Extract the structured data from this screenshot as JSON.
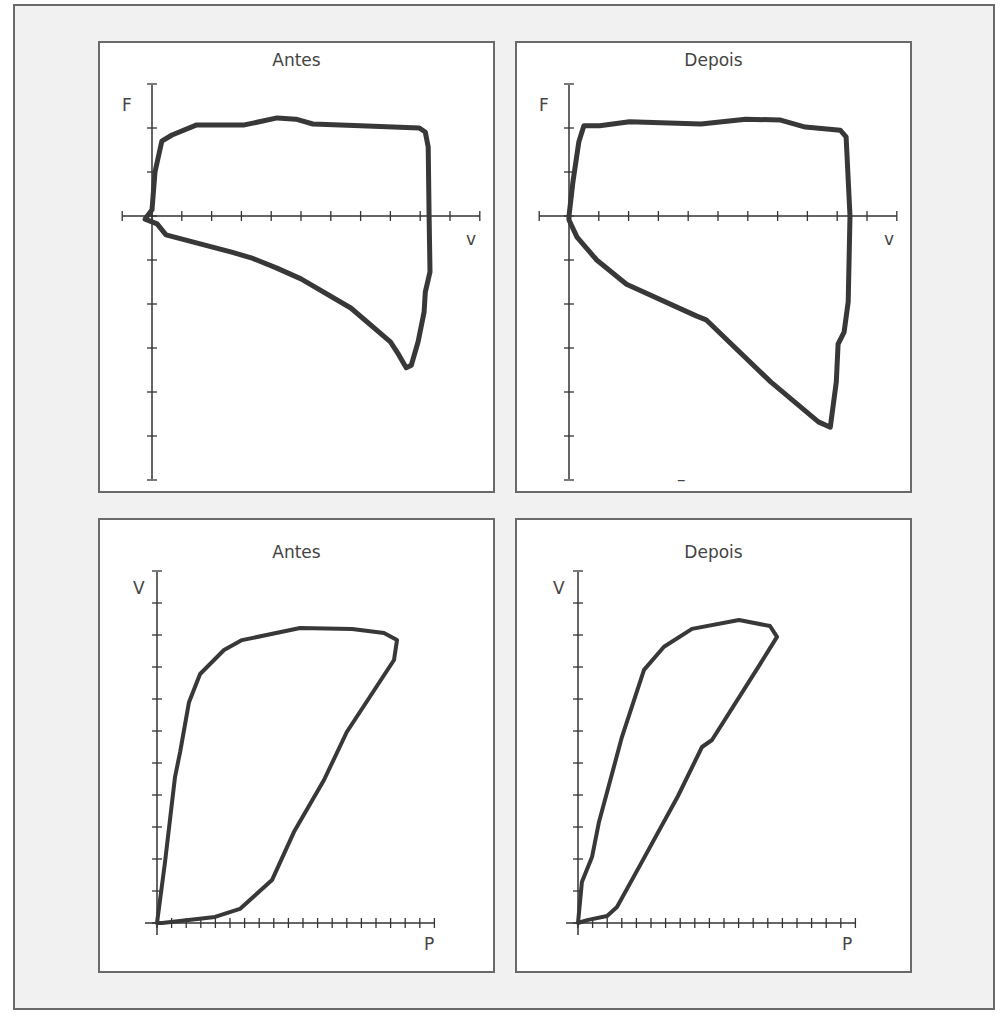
{
  "chart_data": [
    {
      "id": "fv-antes",
      "type": "line",
      "title": "Antes",
      "xlabel": "v",
      "ylabel": "F",
      "xlim": [
        -1,
        11
      ],
      "ylim": [
        -6,
        3
      ],
      "x_ticks": [
        -1,
        0,
        1,
        2,
        3,
        4,
        5,
        6,
        7,
        8,
        9,
        10,
        11
      ],
      "y_ticks": [
        -6,
        -5,
        -4,
        -3,
        -2,
        -1,
        0,
        1,
        2,
        3
      ],
      "grid": false,
      "series": [
        {
          "name": "F-v loop",
          "closed": true,
          "points": [
            [
              0,
              0.14
            ],
            [
              0.1,
              1.0
            ],
            [
              0.33,
              1.7
            ],
            [
              0.67,
              1.84
            ],
            [
              1.5,
              2.07
            ],
            [
              3.1,
              2.07
            ],
            [
              3.6,
              2.14
            ],
            [
              4.2,
              2.23
            ],
            [
              4.83,
              2.2
            ],
            [
              5.4,
              2.09
            ],
            [
              7.0,
              2.05
            ],
            [
              8.97,
              2.0
            ],
            [
              9.17,
              1.91
            ],
            [
              9.27,
              1.57
            ],
            [
              9.3,
              0
            ],
            [
              9.33,
              -1.27
            ],
            [
              9.17,
              -1.73
            ],
            [
              9.13,
              -2.18
            ],
            [
              8.93,
              -2.86
            ],
            [
              8.7,
              -3.39
            ],
            [
              8.53,
              -3.45
            ],
            [
              8.27,
              -3.14
            ],
            [
              8.0,
              -2.86
            ],
            [
              6.67,
              -2.09
            ],
            [
              5.0,
              -1.43
            ],
            [
              4.17,
              -1.18
            ],
            [
              3.33,
              -0.95
            ],
            [
              2.67,
              -0.82
            ],
            [
              2.0,
              -0.7
            ],
            [
              0.47,
              -0.43
            ],
            [
              0.17,
              -0.18
            ],
            [
              -0.23,
              -0.07
            ]
          ]
        }
      ]
    },
    {
      "id": "fv-depois",
      "type": "line",
      "title": "Depois",
      "xlabel": "v",
      "ylabel": "F",
      "xlim": [
        -1,
        11
      ],
      "ylim": [
        -6,
        3
      ],
      "x_ticks": [
        -1,
        0,
        1,
        2,
        3,
        4,
        5,
        6,
        7,
        8,
        9,
        10,
        11
      ],
      "y_ticks": [
        -6,
        -5,
        -4,
        -3,
        -2,
        -1,
        0,
        1,
        2,
        3
      ],
      "grid": false,
      "annotation": "–",
      "series": [
        {
          "name": "F-v loop",
          "closed": true,
          "points": [
            [
              0,
              0
            ],
            [
              0.13,
              0.77
            ],
            [
              0.33,
              1.68
            ],
            [
              0.5,
              2.05
            ],
            [
              1.03,
              2.05
            ],
            [
              2.03,
              2.14
            ],
            [
              4.43,
              2.09
            ],
            [
              5.93,
              2.2
            ],
            [
              7.1,
              2.18
            ],
            [
              7.93,
              2.02
            ],
            [
              9.1,
              1.95
            ],
            [
              9.3,
              1.8
            ],
            [
              9.43,
              0
            ],
            [
              9.37,
              -1.95
            ],
            [
              9.23,
              -2.64
            ],
            [
              9.03,
              -2.91
            ],
            [
              8.97,
              -3.77
            ],
            [
              8.77,
              -4.8
            ],
            [
              8.37,
              -4.68
            ],
            [
              6.77,
              -3.77
            ],
            [
              4.6,
              -2.36
            ],
            [
              4.27,
              -2.27
            ],
            [
              1.93,
              -1.55
            ],
            [
              0.93,
              -1.0
            ],
            [
              0.27,
              -0.48
            ],
            [
              0,
              -0.09
            ]
          ]
        }
      ]
    },
    {
      "id": "vp-antes",
      "type": "line",
      "title": "Antes",
      "xlabel": "P",
      "ylabel": "V",
      "xlim": [
        0,
        19
      ],
      "ylim": [
        0,
        11
      ],
      "x_ticks": [
        0,
        1,
        2,
        3,
        4,
        5,
        6,
        7,
        8,
        9,
        10,
        11,
        12,
        13,
        14,
        15,
        16,
        17,
        18,
        19
      ],
      "y_ticks": [
        0,
        1,
        2,
        3,
        4,
        5,
        6,
        7,
        8,
        9,
        10,
        11
      ],
      "grid": false,
      "series": [
        {
          "name": "P-V loop",
          "closed": true,
          "points": [
            [
              0,
              0
            ],
            [
              0.55,
              1.9
            ],
            [
              1.23,
              4.56
            ],
            [
              1.58,
              5.34
            ],
            [
              2.19,
              6.9
            ],
            [
              2.95,
              7.78
            ],
            [
              4.59,
              8.53
            ],
            [
              5.82,
              8.84
            ],
            [
              9.8,
              9.22
            ],
            [
              13.36,
              9.19
            ],
            [
              15.55,
              9.06
            ],
            [
              16.44,
              8.84
            ],
            [
              16.23,
              8.22
            ],
            [
              13.0,
              5.97
            ],
            [
              11.44,
              4.47
            ],
            [
              9.38,
              2.84
            ],
            [
              7.88,
              1.34
            ],
            [
              5.68,
              0.44
            ],
            [
              3.97,
              0.19
            ],
            [
              0.34,
              0
            ]
          ]
        }
      ]
    },
    {
      "id": "vp-depois",
      "type": "line",
      "title": "Depois",
      "xlabel": "P",
      "ylabel": "V",
      "xlim": [
        0,
        19
      ],
      "ylim": [
        0,
        11
      ],
      "x_ticks": [
        0,
        1,
        2,
        3,
        4,
        5,
        6,
        7,
        8,
        9,
        10,
        11,
        12,
        13,
        14,
        15,
        16,
        17,
        18,
        19
      ],
      "y_ticks": [
        0,
        1,
        2,
        3,
        4,
        5,
        6,
        7,
        8,
        9,
        10,
        11
      ],
      "grid": false,
      "series": [
        {
          "name": "P-V loop",
          "closed": true,
          "points": [
            [
              0,
              0
            ],
            [
              0.27,
              1.28
            ],
            [
              0.96,
              2.06
            ],
            [
              1.44,
              3.16
            ],
            [
              1.99,
              4.09
            ],
            [
              3.01,
              5.81
            ],
            [
              4.52,
              7.91
            ],
            [
              5.89,
              8.63
            ],
            [
              7.81,
              9.19
            ],
            [
              11.03,
              9.47
            ],
            [
              13.15,
              9.28
            ],
            [
              13.63,
              8.94
            ],
            [
              12.47,
              8.09
            ],
            [
              9.18,
              5.72
            ],
            [
              8.49,
              5.5
            ],
            [
              6.85,
              3.97
            ],
            [
              4.38,
              1.91
            ],
            [
              2.67,
              0.5
            ],
            [
              1.99,
              0.22
            ],
            [
              0.62,
              0.09
            ]
          ]
        }
      ]
    }
  ],
  "colors": {
    "curve": "#383838",
    "axis": "#333333",
    "frame_bg": "#f1f1f1",
    "panel_bg": "#ffffff",
    "border": "#6a6a6a",
    "text": "#444444"
  }
}
